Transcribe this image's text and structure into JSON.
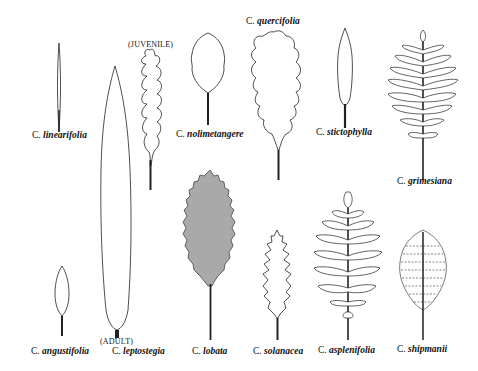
{
  "figure": {
    "fill_gray": "#a9a9a9",
    "stroke": "#222222",
    "background": "#ffffff"
  },
  "leaves": [
    {
      "id": "linearifolia",
      "genus": "C.",
      "species": "linearifolia"
    },
    {
      "id": "quercifolia",
      "genus": "C.",
      "species": "quercifolia"
    },
    {
      "id": "nolimetangere",
      "genus": "C.",
      "species": "nolimetangere"
    },
    {
      "id": "stictophylla",
      "genus": "C.",
      "species": "stictophylla"
    },
    {
      "id": "grimesiana",
      "genus": "C.",
      "species": "grimesiana"
    },
    {
      "id": "angustifolia",
      "genus": "C.",
      "species": "angustifolia"
    },
    {
      "id": "leptostegia",
      "genus": "C.",
      "species": "leptostegia"
    },
    {
      "id": "lobata",
      "genus": "C.",
      "species": "lobata"
    },
    {
      "id": "solanacea",
      "genus": "C.",
      "species": "solanacea"
    },
    {
      "id": "asplenifolia",
      "genus": "C.",
      "species": "asplenifolia"
    },
    {
      "id": "shipmanii",
      "genus": "C.",
      "species": "shipmanii"
    }
  ],
  "notes": {
    "juvenile": "(JUVENILE)",
    "adult": "(ADULT)"
  }
}
